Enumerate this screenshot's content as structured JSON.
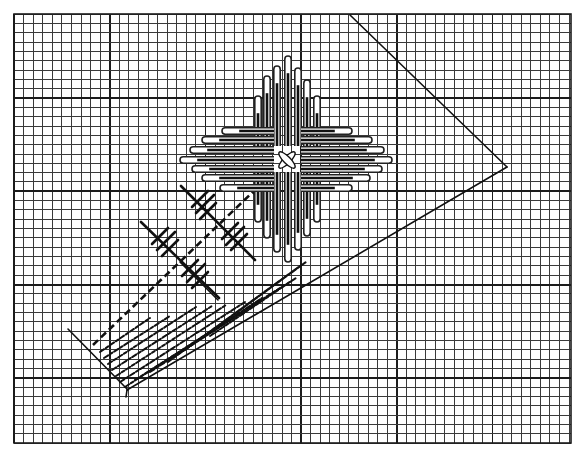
{
  "figure": {
    "title": "Graph-paper construction diagram with cross-shaped loop pattern and hatched strip",
    "background": "#ffffff",
    "ink": "#111111"
  },
  "grid": {
    "x0": 14,
    "y0": 14,
    "x1": 571,
    "y1": 443,
    "dx": 9.57,
    "dy": 9.33,
    "major_every_x": 10,
    "major_offset_x": 0,
    "major_every_y": 10,
    "major_offset_y": 9
  },
  "lines": {
    "triangle_upper_edge": {
      "x1": 350,
      "y1": 15,
      "x2": 507,
      "y2": 167
    },
    "triangle_lower_edge": {
      "x1": 127,
      "y1": 390,
      "x2": 507,
      "y2": 167
    },
    "left_short_edge": {
      "x1": 68,
      "y1": 329,
      "x2": 128,
      "y2": 390
    },
    "left_tail": {
      "x1": 127,
      "y1": 390,
      "x2": 126,
      "y2": 397
    },
    "rect_right_edge": {
      "x1": 180,
      "y1": 262,
      "x2": 218,
      "y2": 300
    },
    "rect_bottom_edge": {
      "x1": 218,
      "y1": 300,
      "x2": 218,
      "y2": 300
    },
    "dashed_axis": {
      "x1": 93,
      "y1": 345,
      "x2": 257,
      "y2": 188
    }
  },
  "crosses": [
    {
      "cx": 180,
      "cy": 260,
      "long": {
        "x1": 141,
        "y1": 222,
        "x2": 219,
        "y2": 298
      },
      "ticks": [
        {
          "x1": 152,
          "y1": 244,
          "x2": 168,
          "y2": 228
        },
        {
          "x1": 157,
          "y1": 250,
          "x2": 175,
          "y2": 232
        },
        {
          "x1": 162,
          "y1": 256,
          "x2": 178,
          "y2": 240
        },
        {
          "x1": 182,
          "y1": 276,
          "x2": 198,
          "y2": 260
        },
        {
          "x1": 187,
          "y1": 282,
          "x2": 205,
          "y2": 264
        },
        {
          "x1": 192,
          "y1": 288,
          "x2": 208,
          "y2": 272
        }
      ]
    },
    {
      "cx": 218,
      "cy": 222,
      "long": {
        "x1": 181,
        "y1": 186,
        "x2": 255,
        "y2": 260
      },
      "ticks": [
        {
          "x1": 192,
          "y1": 207,
          "x2": 208,
          "y2": 191
        },
        {
          "x1": 196,
          "y1": 213,
          "x2": 214,
          "y2": 195
        },
        {
          "x1": 200,
          "y1": 219,
          "x2": 216,
          "y2": 203
        },
        {
          "x1": 222,
          "y1": 239,
          "x2": 238,
          "y2": 223
        },
        {
          "x1": 226,
          "y1": 245,
          "x2": 244,
          "y2": 227
        },
        {
          "x1": 231,
          "y1": 250,
          "x2": 247,
          "y2": 234
        }
      ]
    }
  ],
  "hatch_strokes": [
    {
      "x1": 100,
      "y1": 352,
      "x2": 150,
      "y2": 318
    },
    {
      "x1": 104,
      "y1": 358,
      "x2": 170,
      "y2": 316
    },
    {
      "x1": 108,
      "y1": 364,
      "x2": 196,
      "y2": 307
    },
    {
      "x1": 112,
      "y1": 370,
      "x2": 212,
      "y2": 306
    },
    {
      "x1": 116,
      "y1": 376,
      "x2": 226,
      "y2": 305
    },
    {
      "x1": 120,
      "y1": 382,
      "x2": 245,
      "y2": 302
    },
    {
      "x1": 125,
      "y1": 387,
      "x2": 262,
      "y2": 298
    },
    {
      "x1": 135,
      "y1": 380,
      "x2": 280,
      "y2": 288
    },
    {
      "x1": 150,
      "y1": 372,
      "x2": 296,
      "y2": 278
    },
    {
      "x1": 168,
      "y1": 362,
      "x2": 300,
      "y2": 266
    },
    {
      "x1": 185,
      "y1": 350,
      "x2": 306,
      "y2": 262
    },
    {
      "x1": 210,
      "y1": 336,
      "x2": 290,
      "y2": 282
    }
  ],
  "center": {
    "cx": 287,
    "cy": 160
  },
  "loops": {
    "top": [
      {
        "x": 258,
        "tip": 96
      },
      {
        "x": 267,
        "tip": 76
      },
      {
        "x": 277,
        "tip": 66
      },
      {
        "x": 288,
        "tip": 56
      },
      {
        "x": 298,
        "tip": 68
      },
      {
        "x": 307,
        "tip": 80
      },
      {
        "x": 317,
        "tip": 96
      }
    ],
    "bottom": [
      {
        "x": 258,
        "tip": 222
      },
      {
        "x": 267,
        "tip": 238
      },
      {
        "x": 277,
        "tip": 252
      },
      {
        "x": 288,
        "tip": 262
      },
      {
        "x": 298,
        "tip": 250
      },
      {
        "x": 307,
        "tip": 236
      },
      {
        "x": 317,
        "tip": 222
      }
    ],
    "left": [
      {
        "y": 131,
        "tip": 222
      },
      {
        "y": 140,
        "tip": 202
      },
      {
        "y": 150,
        "tip": 190
      },
      {
        "y": 160,
        "tip": 180
      },
      {
        "y": 169,
        "tip": 192
      },
      {
        "y": 178,
        "tip": 202
      },
      {
        "y": 188,
        "tip": 220
      }
    ],
    "right": [
      {
        "y": 131,
        "tip": 352
      },
      {
        "y": 140,
        "tip": 372
      },
      {
        "y": 150,
        "tip": 384
      },
      {
        "y": 160,
        "tip": 392
      },
      {
        "y": 169,
        "tip": 382
      },
      {
        "y": 178,
        "tip": 370
      },
      {
        "y": 188,
        "tip": 352
      }
    ],
    "half_width": 3.2,
    "inner_x": {
      "left": 268,
      "right": 307
    },
    "inner_y": {
      "top": 140,
      "bottom": 178
    }
  }
}
